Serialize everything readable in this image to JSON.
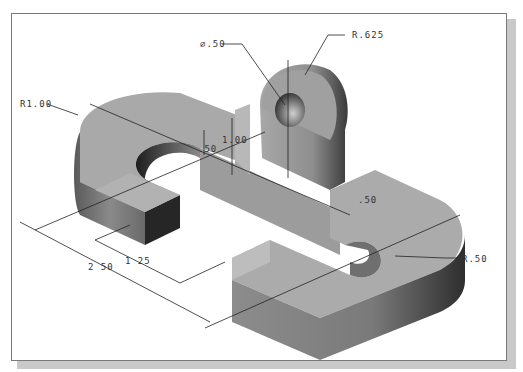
{
  "figure": {
    "type": "isometric shaded solid model with dimensions",
    "dimensions": {
      "hole_diameter": "∅.50",
      "boss_radius": "R.625",
      "outer_radius_left": "R1.00",
      "step_height": ".50",
      "total_height": "1.00",
      "slot_width": ".50",
      "inner_radius_right": "R.50",
      "width_small": "1 25",
      "width_overall": "2 50"
    }
  }
}
